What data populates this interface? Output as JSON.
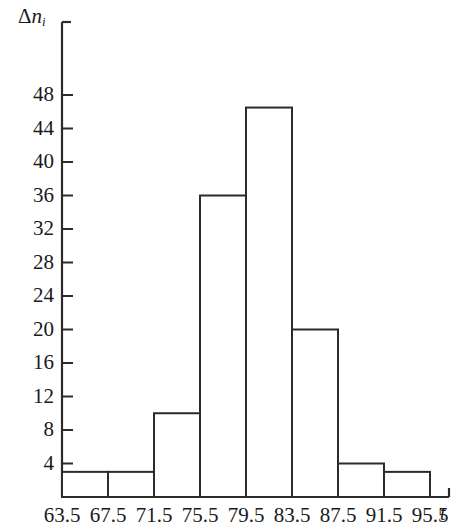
{
  "chart_data": {
    "type": "bar",
    "title": "",
    "subtitle": "",
    "xlabel": "t",
    "ylabel": "Δn",
    "ylabel_delta": "Δ",
    "ylabel_symbol": "n",
    "ylabel_subscript": "i",
    "bin_edges": [
      63.5,
      67.5,
      71.5,
      75.5,
      79.5,
      83.5,
      87.5,
      91.5,
      95.5,
      99.5
    ],
    "categories": [
      "63.5–67.5",
      "67.5–71.5",
      "71.5–75.5",
      "75.5–79.5",
      "79.5–83.5",
      "83.5–87.5",
      "87.5–91.5",
      "91.5–95.5",
      "95.5–99.5"
    ],
    "values": [
      3,
      3,
      10,
      36,
      46.5,
      20,
      4,
      3,
      0
    ],
    "xticks": [
      "63.5",
      "67.5",
      "71.5",
      "75.5",
      "79.5",
      "83.5",
      "87.5",
      "91.5",
      "95.5"
    ],
    "xtick_values": [
      63.5,
      67.5,
      71.5,
      75.5,
      79.5,
      83.5,
      87.5,
      91.5,
      95.5
    ],
    "yticks": [
      "4",
      "8",
      "12",
      "16",
      "20",
      "24",
      "28",
      "32",
      "36",
      "40",
      "44",
      "48"
    ],
    "ytick_values": [
      4,
      8,
      12,
      16,
      20,
      24,
      28,
      32,
      36,
      40,
      44,
      48
    ],
    "ylim": [
      0,
      52
    ],
    "xlim": [
      63.5,
      99.5
    ],
    "grid": false,
    "legend": false,
    "bar_fill": "#ffffff",
    "bar_stroke": "#2b2b2b",
    "axis_color": "#2b2b2b",
    "background": "#ffffff"
  }
}
